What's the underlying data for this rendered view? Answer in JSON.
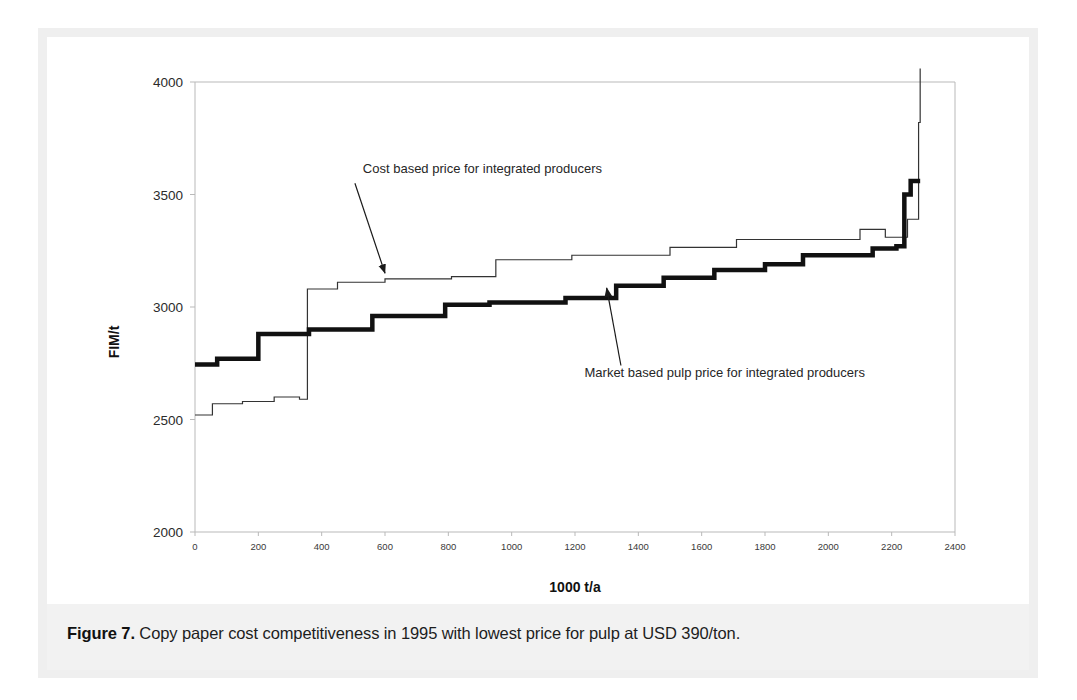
{
  "figure": {
    "caption_label": "Figure 7.",
    "caption_body": " Copy paper cost competitiveness in 1995 with lowest price for pulp at USD 390/ton."
  },
  "chart_data": {
    "type": "line",
    "title": "",
    "subtitle": "",
    "xlabel": "1000 t/a",
    "ylabel": "FIM/t",
    "xlim": [
      0,
      2400
    ],
    "ylim": [
      2000,
      4000
    ],
    "xticks": [
      0,
      200,
      400,
      600,
      800,
      1000,
      1200,
      1400,
      1600,
      1800,
      2000,
      2200,
      2400
    ],
    "xtick_labels": [
      "0",
      "200",
      "400",
      "600",
      "800",
      "1000",
      "1200",
      "1400",
      "1600",
      "1800",
      "2000",
      "2200",
      "2400"
    ],
    "yticks": [
      2000,
      2500,
      3000,
      3500,
      4000
    ],
    "ytick_labels": [
      "2000",
      "2500",
      "3000",
      "3500",
      "4000"
    ],
    "grid": false,
    "legend_position": "none",
    "drawstyle": "steps-post",
    "series": [
      {
        "name": "Market based pulp price for integrated producers",
        "style": "thick-black-step",
        "color": "#111111",
        "linewidth": 4.5,
        "x": [
          0,
          55,
          70,
          130,
          200,
          350,
          360,
          430,
          560,
          580,
          790,
          800,
          930,
          1010,
          1170,
          1180,
          1330,
          1360,
          1480,
          1500,
          1640,
          1660,
          1800,
          1830,
          1920,
          1940,
          2140,
          2160,
          2215,
          2230,
          2240,
          2260,
          2290
        ],
        "y": [
          2745,
          2745,
          2770,
          2770,
          2880,
          2880,
          2900,
          2900,
          2960,
          2960,
          3010,
          3010,
          3020,
          3020,
          3040,
          3040,
          3095,
          3095,
          3130,
          3130,
          3165,
          3165,
          3190,
          3190,
          3230,
          3230,
          3260,
          3260,
          3270,
          3270,
          3500,
          3560,
          3560
        ]
      },
      {
        "name": "Cost based price for integrated producers",
        "style": "thin-black-step",
        "color": "#333333",
        "linewidth": 1.2,
        "x": [
          0,
          40,
          55,
          130,
          150,
          230,
          250,
          300,
          330,
          350,
          355,
          430,
          450,
          580,
          600,
          790,
          810,
          930,
          950,
          1170,
          1190,
          1480,
          1500,
          1690,
          1710,
          2080,
          2100,
          2160,
          2180,
          2230,
          2250,
          2270,
          2285,
          2290
        ],
        "y": [
          2520,
          2520,
          2570,
          2570,
          2580,
          2580,
          2600,
          2600,
          2590,
          2590,
          3080,
          3080,
          3110,
          3110,
          3125,
          3125,
          3135,
          3135,
          3210,
          3210,
          3230,
          3230,
          3265,
          3265,
          3300,
          3300,
          3345,
          3345,
          3310,
          3310,
          3390,
          3390,
          3820,
          4060
        ]
      }
    ],
    "annotations": [
      {
        "id": "cost-based-annotation",
        "text": "Cost based price for integrated producers",
        "text_x": 530,
        "text_y": 3595,
        "arrow_from_x": 505,
        "arrow_from_y": 3550,
        "arrow_to_x": 600,
        "arrow_to_y": 3150
      },
      {
        "id": "market-based-annotation",
        "text": "Market based pulp price for integrated producers",
        "text_x": 1230,
        "text_y": 2690,
        "arrow_from_x": 1345,
        "arrow_from_y": 2740,
        "arrow_to_x": 1300,
        "arrow_to_y": 3085
      }
    ]
  }
}
